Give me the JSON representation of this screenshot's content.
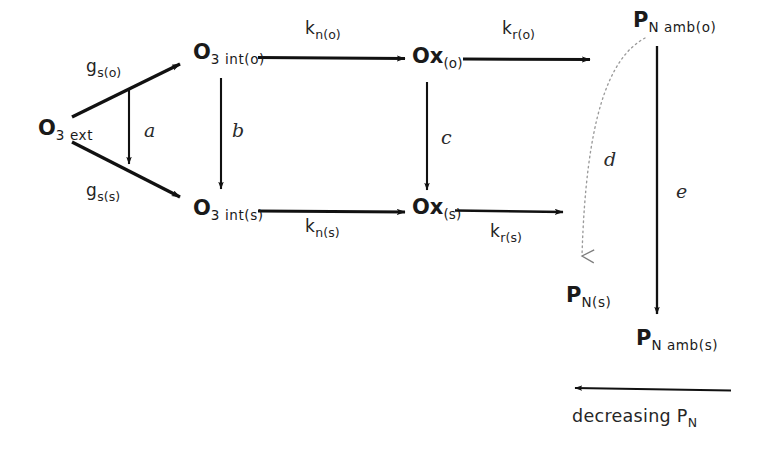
{
  "diagram": {
    "background_color": "#ffffff",
    "stroke_color": "#111111",
    "dotted_stroke_color": "#8a8a8a",
    "nodes": [
      {
        "id": "o3ext",
        "base": "O",
        "sub": "3 ext",
        "x": 38,
        "y": 118
      },
      {
        "id": "o3into",
        "base": "O",
        "sub": "3 int(o)",
        "x": 193,
        "y": 42
      },
      {
        "id": "o3ints",
        "base": "O",
        "sub": "3 int(s)",
        "x": 193,
        "y": 198
      },
      {
        "id": "oxo",
        "base": "Ox",
        "sub": "(o)",
        "x": 412,
        "y": 46
      },
      {
        "id": "oxs",
        "base": "Ox",
        "sub": "(s)",
        "x": 412,
        "y": 197
      },
      {
        "id": "pnambo",
        "base": "P",
        "sub": "N amb(o)",
        "x": 633,
        "y": 10
      },
      {
        "id": "pns",
        "base": "P",
        "sub": "N(s)",
        "x": 566,
        "y": 285
      },
      {
        "id": "pnambs",
        "base": "P",
        "sub": "N amb(s)",
        "x": 636,
        "y": 328
      }
    ],
    "rate_labels": [
      {
        "id": "gso",
        "base": "g",
        "sub": "s(o)",
        "x": 86,
        "y": 58
      },
      {
        "id": "gss",
        "base": "g",
        "sub": "s(s)",
        "x": 86,
        "y": 182
      },
      {
        "id": "kno",
        "base": "k",
        "sub": "n(o)",
        "x": 305,
        "y": 20
      },
      {
        "id": "kns",
        "base": "k",
        "sub": "n(s)",
        "x": 305,
        "y": 218
      },
      {
        "id": "kro",
        "base": "k",
        "sub": "r(o)",
        "x": 502,
        "y": 20
      },
      {
        "id": "krs",
        "base": "k",
        "sub": "r(s)",
        "x": 490,
        "y": 223
      }
    ],
    "path_labels": [
      {
        "id": "a",
        "text": "a",
        "x": 144,
        "y": 121
      },
      {
        "id": "b",
        "text": "b",
        "x": 232,
        "y": 121
      },
      {
        "id": "c",
        "text": "c",
        "x": 441,
        "y": 128
      },
      {
        "id": "d",
        "text": "d",
        "x": 604,
        "y": 150
      },
      {
        "id": "e",
        "text": "e",
        "x": 676,
        "y": 182
      }
    ],
    "caption": {
      "id": "decreasing-pn",
      "base": "decreasing P",
      "sub": "N",
      "x": 572,
      "y": 408
    },
    "edges": [
      {
        "id": "gso-arrow",
        "type": "solid-diagonal",
        "from": [
          72,
          117
        ],
        "to": [
          184,
          62
        ],
        "label": "g_s(o)"
      },
      {
        "id": "gss-arrow",
        "type": "solid-diagonal",
        "from": [
          72,
          142
        ],
        "to": [
          184,
          199
        ],
        "label": "g_s(s)"
      },
      {
        "id": "a-arrow",
        "type": "solid-vertical",
        "from": [
          129,
          90
        ],
        "to": [
          129,
          168
        ],
        "label": "a"
      },
      {
        "id": "b-arrow",
        "type": "solid-vertical",
        "from": [
          221,
          78
        ],
        "to": [
          221,
          193
        ],
        "label": "b"
      },
      {
        "id": "c-arrow",
        "type": "solid-vertical",
        "from": [
          427,
          82
        ],
        "to": [
          427,
          194
        ],
        "label": "c"
      },
      {
        "id": "kno-arrow",
        "type": "solid-horizontal",
        "from": [
          258,
          57
        ],
        "to": [
          409,
          57
        ],
        "label": "k_n(o)"
      },
      {
        "id": "kns-arrow",
        "type": "solid-horizontal",
        "from": [
          258,
          212
        ],
        "to": [
          409,
          212
        ],
        "label": "k_n(s)"
      },
      {
        "id": "kro-arrow",
        "type": "solid-horizontal",
        "from": [
          463,
          59
        ],
        "to": [
          594,
          59
        ],
        "label": "k_r(o)"
      },
      {
        "id": "krs-arrow",
        "type": "solid-horizontal",
        "from": [
          455,
          212
        ],
        "to": [
          567,
          212
        ],
        "label": "k_r(s)"
      },
      {
        "id": "d-curve",
        "type": "dotted-curve",
        "from": [
          645,
          38
        ],
        "to": [
          582,
          268
        ],
        "label": "d"
      },
      {
        "id": "e-arrow",
        "type": "solid-vertical",
        "from": [
          657,
          46
        ],
        "to": [
          657,
          318
        ],
        "label": "e"
      },
      {
        "id": "decreasing-arrow",
        "type": "solid-horizontal-left",
        "from": [
          731,
          389
        ],
        "to": [
          571,
          389
        ],
        "label": "decreasing P_N"
      }
    ]
  }
}
